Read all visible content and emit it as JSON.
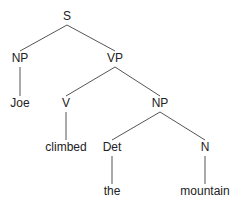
{
  "diagram": {
    "type": "parse-tree",
    "colors": {
      "edge": "#555555",
      "text": "#222222",
      "background": "#ffffff"
    },
    "nodes": [
      {
        "id": "S",
        "label": "S",
        "x": 67,
        "y": 17
      },
      {
        "id": "NP1",
        "label": "NP",
        "x": 20,
        "y": 59
      },
      {
        "id": "VP",
        "label": "VP",
        "x": 115,
        "y": 59
      },
      {
        "id": "Joe",
        "label": "Joe",
        "x": 20,
        "y": 104
      },
      {
        "id": "V",
        "label": "V",
        "x": 66,
        "y": 104
      },
      {
        "id": "NP2",
        "label": "NP",
        "x": 160,
        "y": 104
      },
      {
        "id": "climbed",
        "label": "climbed",
        "x": 66,
        "y": 148
      },
      {
        "id": "Det",
        "label": "Det",
        "x": 112,
        "y": 148
      },
      {
        "id": "N",
        "label": "N",
        "x": 205,
        "y": 148
      },
      {
        "id": "the",
        "label": "the",
        "x": 112,
        "y": 192
      },
      {
        "id": "mountain",
        "label": "mountain",
        "x": 205,
        "y": 192
      }
    ],
    "edges": [
      {
        "from": "S",
        "to": "NP1"
      },
      {
        "from": "S",
        "to": "VP"
      },
      {
        "from": "NP1",
        "to": "Joe"
      },
      {
        "from": "VP",
        "to": "V"
      },
      {
        "from": "VP",
        "to": "NP2"
      },
      {
        "from": "V",
        "to": "climbed"
      },
      {
        "from": "NP2",
        "to": "Det"
      },
      {
        "from": "NP2",
        "to": "N"
      },
      {
        "from": "Det",
        "to": "the"
      },
      {
        "from": "N",
        "to": "mountain"
      }
    ]
  }
}
